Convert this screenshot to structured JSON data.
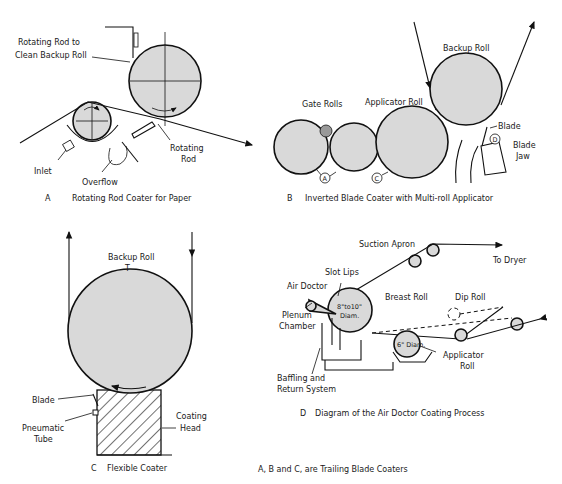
{
  "figure": {
    "footnote": "A, B and C, are Trailing Blade Coaters"
  },
  "panels": {
    "a": {
      "letter": "A",
      "caption": "Rotating Rod Coater for Paper",
      "labels": {
        "rotating_rod_clean_1": "Rotating Rod to",
        "rotating_rod_clean_2": "Clean Backup Roll",
        "inlet": "Inlet",
        "overflow": "Overflow",
        "rotating_rod_1": "Rotating",
        "rotating_rod_2": "Rod"
      }
    },
    "b": {
      "letter": "B",
      "caption": "Inverted Blade Coater with Multi-roll Applicator",
      "labels": {
        "backup_roll": "Backup Roll",
        "gate_rolls": "Gate Rolls",
        "applicator_roll": "Applicator Roll",
        "blade": "Blade",
        "blade_jaw_1": "Blade",
        "blade_jaw_2": "Jaw",
        "marker_a": "A",
        "marker_c": "C",
        "marker_d": "D"
      }
    },
    "c": {
      "letter": "C",
      "caption": "Flexible Coater",
      "labels": {
        "backup_roll": "Backup Roll",
        "blade": "Blade",
        "pneumatic_1": "Pneumatic",
        "pneumatic_2": "Tube",
        "coating_1": "Coating",
        "coating_2": "Head"
      }
    },
    "d": {
      "letter": "D",
      "caption": "Diagram of the Air Doctor Coating Process",
      "labels": {
        "suction_apron": "Suction Apron",
        "to_dryer": "To Dryer",
        "slot_lips": "Slot Lips",
        "air_doctor": "Air Doctor",
        "breast_roll": "Breast Roll",
        "dip_roll": "Dip Roll",
        "plenum_1": "Plenum",
        "plenum_2": "Chamber",
        "breast_diam_1": "8\"to10\"",
        "breast_diam_2": "Diam.",
        "applicator_diam": "6\" Diam.",
        "applicator_1": "Applicator",
        "applicator_2": "Roll",
        "baffling_1": "Baffling  and",
        "baffling_2": "Return System"
      }
    }
  }
}
